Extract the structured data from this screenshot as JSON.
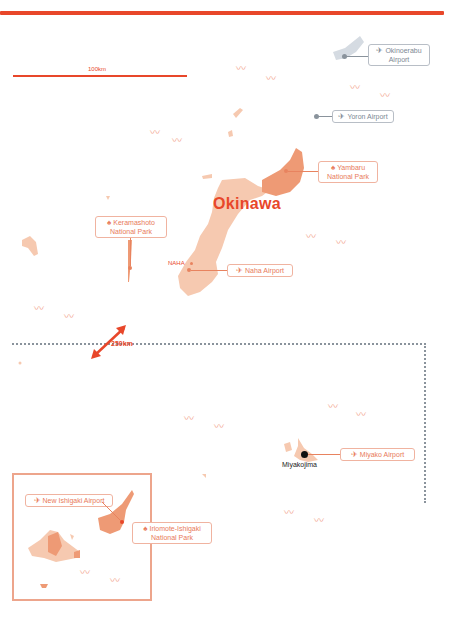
{
  "map": {
    "title": "Okinawa",
    "scale_bar_label": "100km",
    "distance_label": "250km",
    "city_label": "NAHA",
    "miyako_city_label": "Miyakojima",
    "colors": {
      "accent": "#e8472a",
      "island_light": "#f6c9b0",
      "island_dark": "#ee9a75",
      "label_border": "#f0b3a0",
      "grey": "#8a939c"
    }
  },
  "labels": {
    "okinoerabu_airport": {
      "icon": "airplane-icon",
      "line1": "Okinoerabu",
      "line2": "Airport"
    },
    "yoron_airport": {
      "icon": "airplane-icon",
      "line1": "Yoron Airport"
    },
    "yambaru_park": {
      "icon": "tree-icon",
      "line1": "Yambaru",
      "line2": "National Park"
    },
    "keramashoto_park": {
      "icon": "tree-icon",
      "line1": "Keramashoto",
      "line2": "National Park"
    },
    "naha_airport": {
      "icon": "airplane-icon",
      "line1": "Naha Airport"
    },
    "miyako_airport": {
      "icon": "airplane-icon",
      "line1": "Miyako Airport"
    },
    "new_ishigaki_airport": {
      "icon": "airplane-icon",
      "line1": "New Ishigaki Airport"
    },
    "iriomote_park": {
      "icon": "tree-icon",
      "line1": "Iriomote-Ishigaki",
      "line2": "National Park"
    }
  },
  "icons": {
    "airplane": "✈",
    "tree": "♠"
  }
}
